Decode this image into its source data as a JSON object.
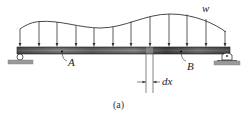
{
  "figure": {
    "caption": "(a)",
    "load_label": "w",
    "point_a_label": "A",
    "point_b_label": "B",
    "segment_label": "dx"
  },
  "beam": {
    "x_start": 17,
    "x_end": 230,
    "top": 47,
    "height": 7,
    "color_dark": "#3a3a3a",
    "color_light": "#9a9a9a"
  },
  "load": {
    "arrow_x": [
      20,
      39,
      57,
      76,
      94,
      113,
      131,
      150,
      169,
      187,
      206,
      225
    ],
    "curve_color": "#333333"
  },
  "supports": {
    "left": "pin",
    "right": "roller"
  }
}
